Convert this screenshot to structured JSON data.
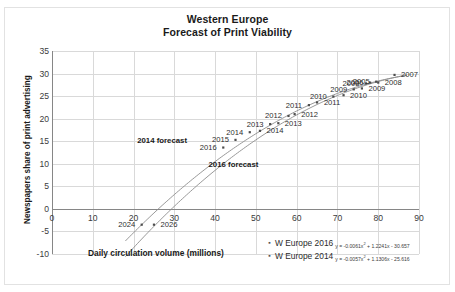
{
  "chart_data": {
    "type": "scatter",
    "title": "Western Europe",
    "subtitle": "Forecast of Print Viability",
    "xlabel": "Daily circulation volume (millions)",
    "ylabel": "Newspapers share of print advertising",
    "xlim": [
      0,
      90
    ],
    "ylim": [
      -10,
      35
    ],
    "xticks": [
      0,
      10,
      20,
      30,
      40,
      50,
      60,
      70,
      80,
      90
    ],
    "yticks": [
      35,
      30,
      25,
      20,
      15,
      10,
      5,
      0,
      -5,
      -10
    ],
    "grid": true,
    "legend_position": "bottom-right",
    "annotations": [
      {
        "text": "2014 forecast",
        "x": 27.0,
        "y": 15.2
      },
      {
        "text": "2016 forecast",
        "x": 44.5,
        "y": 10.0
      }
    ],
    "series": [
      {
        "name": "W Europe 2016",
        "equation": "y = -0.0061x² + 1.2241x - 30.657",
        "equation_coefficients": {
          "a": -0.0061,
          "b": 1.2241,
          "c": -30.657
        },
        "marker": "small-dot",
        "points": [
          {
            "label": "2007",
            "x": 84.0,
            "y": 29.7
          },
          {
            "label": "2008",
            "x": 80.0,
            "y": 28.0
          },
          {
            "label": "2009",
            "x": 76.0,
            "y": 26.7
          },
          {
            "label": "2010",
            "x": 71.5,
            "y": 25.2
          },
          {
            "label": "2011",
            "x": 65.0,
            "y": 23.6
          },
          {
            "label": "2012",
            "x": 59.5,
            "y": 21.0
          },
          {
            "label": "2013",
            "x": 55.5,
            "y": 19.0
          },
          {
            "label": "2014",
            "x": 51.0,
            "y": 17.3
          },
          {
            "label": "2026",
            "x": 25.0,
            "y": -3.5
          }
        ]
      },
      {
        "name": "W Europe 2014",
        "equation": "y = -0.0057x² + 1.1306x - 25.616",
        "equation_coefficients": {
          "a": -0.0057,
          "b": 1.1306,
          "c": -25.616
        },
        "marker": "small-dot",
        "points": [
          {
            "label": "2005",
            "x": 79.5,
            "y": 28.2
          },
          {
            "label": "2006",
            "x": 78.0,
            "y": 28.0
          },
          {
            "label": "2008",
            "x": 77.0,
            "y": 27.8
          },
          {
            "label": "2009",
            "x": 74.0,
            "y": 26.5
          },
          {
            "label": "2010",
            "x": 69.0,
            "y": 24.9
          },
          {
            "label": "2011",
            "x": 63.0,
            "y": 23.0
          },
          {
            "label": "2012",
            "x": 58.0,
            "y": 20.6
          },
          {
            "label": "2013",
            "x": 53.5,
            "y": 18.8
          },
          {
            "label": "2014",
            "x": 48.5,
            "y": 17.0
          },
          {
            "label": "2015",
            "x": 45.0,
            "y": 15.3
          },
          {
            "label": "2016",
            "x": 42.0,
            "y": 13.6
          },
          {
            "label": "2024",
            "x": 22.0,
            "y": -3.5
          }
        ]
      }
    ]
  },
  "legend": {
    "entries": [
      {
        "label": "W Europe 2016",
        "equation_prefix": "y = -0.0061x",
        "equation_sup": "2",
        "equation_rest": " + 1.2241x - 30.657"
      },
      {
        "label": "W Europe 2014",
        "equation_prefix": "y = -0.0057x",
        "equation_sup": "2",
        "equation_rest": " + 1.1306x - 25.616"
      }
    ]
  }
}
